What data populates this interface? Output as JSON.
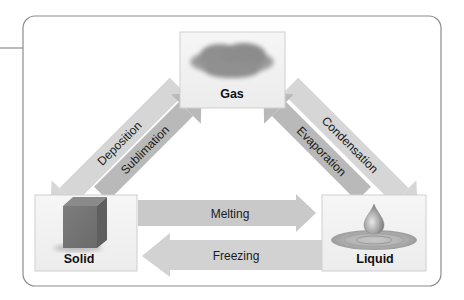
{
  "diagram": {
    "states": {
      "gas": {
        "label": "Gas",
        "icon": "cloud-icon"
      },
      "solid": {
        "label": "Solid",
        "icon": "cube-icon"
      },
      "liquid": {
        "label": "Liquid",
        "icon": "droplet-icon"
      }
    },
    "transitions": {
      "deposition": {
        "label": "Deposition",
        "from": "Gas",
        "to": "Solid"
      },
      "sublimation": {
        "label": "Sublimation",
        "from": "Solid",
        "to": "Gas"
      },
      "condensation": {
        "label": "Condensation",
        "from": "Gas",
        "to": "Liquid"
      },
      "evaporation": {
        "label": "Evaporation",
        "from": "Liquid",
        "to": "Gas"
      },
      "melting": {
        "label": "Melting",
        "from": "Solid",
        "to": "Liquid"
      },
      "freezing": {
        "label": "Freezing",
        "from": "Liquid",
        "to": "Solid"
      }
    },
    "colors": {
      "arrow_light": "#d4d4d4",
      "arrow_dark": "#b5b5b5",
      "box_fill": "#f2f2f2",
      "frame": "#8c8c8c"
    }
  }
}
